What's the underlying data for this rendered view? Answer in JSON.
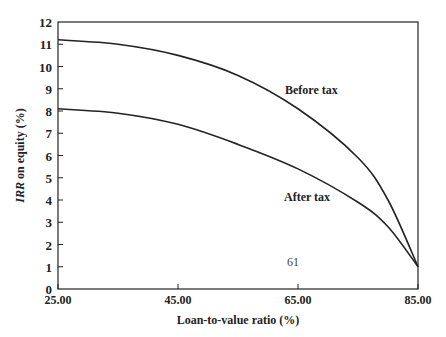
{
  "chart_data": {
    "type": "line",
    "title": "",
    "xlabel": "Loan-to-value ratio (%)",
    "ylabel_italic": "IRR",
    "ylabel_rest": " on equity (%)",
    "ylabel": "IRR on equity (%)",
    "xlim": [
      25,
      85
    ],
    "ylim": [
      0,
      12
    ],
    "x_ticks": [
      "25.00",
      "45.00",
      "65.00",
      "85.00"
    ],
    "y_ticks": [
      "0",
      "1",
      "2",
      "3",
      "4",
      "5",
      "6",
      "7",
      "8",
      "9",
      "10",
      "11",
      "12"
    ],
    "grid": false,
    "x": [
      25,
      35,
      45,
      55,
      65,
      75,
      80,
      85
    ],
    "series": [
      {
        "name": "Before tax",
        "values": [
          11.2,
          11.0,
          10.5,
          9.6,
          8.1,
          5.9,
          4.0,
          1.0
        ]
      },
      {
        "name": "After tax",
        "values": [
          8.1,
          7.9,
          7.4,
          6.5,
          5.4,
          3.9,
          2.8,
          1.0
        ]
      }
    ],
    "annotations": [
      "Before tax",
      "After tax",
      "61"
    ]
  },
  "labels": {
    "before_tax": "Before tax",
    "after_tax": "After tax",
    "page_number": "61"
  }
}
